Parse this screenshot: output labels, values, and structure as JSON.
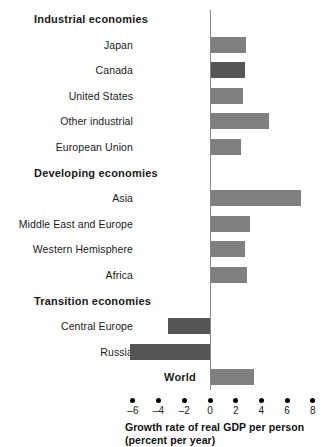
{
  "chart_data": {
    "type": "bar",
    "orientation": "horizontal",
    "title": "",
    "xlabel": "Growth rate of real GDP per person (percent per year)",
    "xlabel_line1": "Growth rate of real GDP per person",
    "xlabel_line2": "(percent per year)",
    "ylabel": "",
    "xlim": [
      -6.6,
      8.6
    ],
    "xticks": [
      -6,
      -4,
      -2,
      0,
      2,
      4,
      6,
      8
    ],
    "xticklabels": [
      "–6",
      "–4",
      "–2",
      "0",
      "2",
      "4",
      "6",
      "8"
    ],
    "grid": false,
    "legend": "none",
    "zero_line": 0,
    "groups": [
      {
        "label": "Industrial economies",
        "type": "group-heading",
        "items": [
          {
            "label": "Japan",
            "value": 2.8,
            "color": "#808080"
          },
          {
            "label": "Canada",
            "value": 2.7,
            "color": "#555555"
          },
          {
            "label": "United States",
            "value": 2.6,
            "color": "#808080"
          },
          {
            "label": "Other industrial",
            "value": 4.6,
            "color": "#808080"
          },
          {
            "label": "European Union",
            "value": 2.4,
            "color": "#808080"
          }
        ]
      },
      {
        "label": "Developing economies",
        "type": "group-heading",
        "items": [
          {
            "label": "Asia",
            "value": 7.1,
            "color": "#808080"
          },
          {
            "label": "Middle East and Europe",
            "value": 3.1,
            "color": "#808080"
          },
          {
            "label": "Western Hemisphere",
            "value": 2.7,
            "color": "#808080"
          },
          {
            "label": "Africa",
            "value": 2.9,
            "color": "#808080"
          }
        ]
      },
      {
        "label": "Transition economies",
        "type": "group-heading",
        "items": [
          {
            "label": "Central Europe",
            "value": -3.3,
            "color": "#555555"
          },
          {
            "label": "Russia",
            "value": -6.2,
            "color": "#555555"
          }
        ]
      },
      {
        "label": "World",
        "type": "total-heading",
        "items": [
          {
            "label": "",
            "value": 3.4,
            "color": "#808080"
          }
        ]
      }
    ]
  }
}
